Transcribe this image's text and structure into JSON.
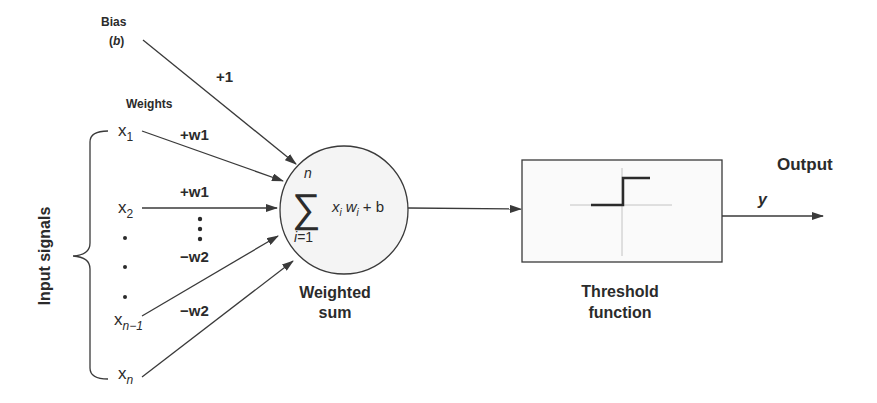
{
  "diagram": {
    "type": "perceptron",
    "bias": {
      "label": "Bias",
      "symbol": "(b)",
      "weight_label": "+1"
    },
    "weights_heading": "Weights",
    "inputs_label": "Input signals",
    "inputs": [
      {
        "base": "x",
        "sub": "1",
        "weight": "+w1"
      },
      {
        "base": "x",
        "sub": "2",
        "weight": "+w1"
      },
      {
        "base": "x",
        "sub": "n−1",
        "weight": "−w2"
      },
      {
        "base": "x",
        "sub": "n",
        "weight": "−w2"
      }
    ],
    "ellipsis_dots": "•",
    "summation": {
      "sigma": "∑",
      "upper": "n",
      "lower": "i=1",
      "term_x": "x",
      "term_i": "i",
      "term_w": "w",
      "term_plus_b": "+ b",
      "caption_line1": "Weighted",
      "caption_line2": "sum"
    },
    "threshold": {
      "caption_line1": "Threshold",
      "caption_line2": "function"
    },
    "output": {
      "label": "Output",
      "symbol": "y"
    },
    "colors": {
      "stroke": "#3a3a3a",
      "text": "#2b2b2b",
      "node_fill": "#f4f4f4",
      "box_fill": "#fafafa"
    }
  }
}
